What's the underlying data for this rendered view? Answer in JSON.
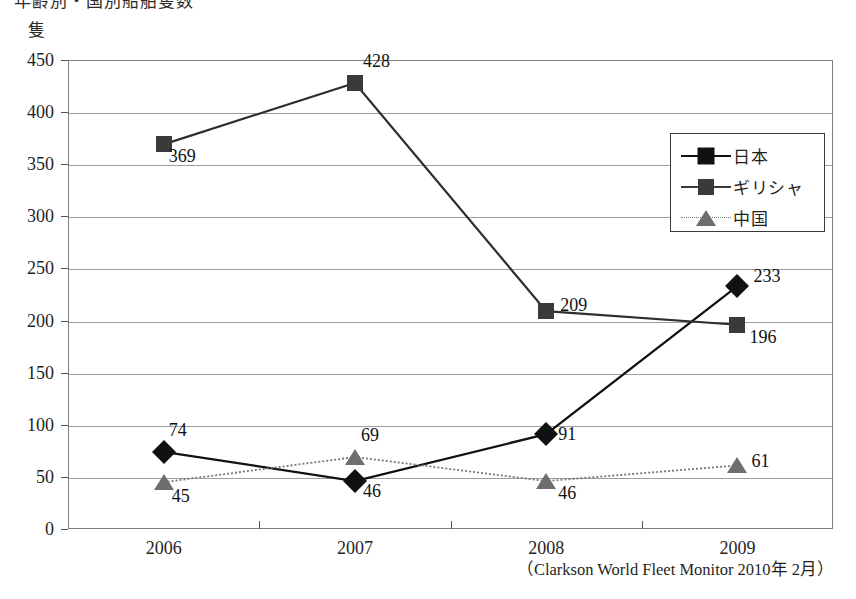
{
  "title_cut_off": "年齢別・国別船舶隻数",
  "unit_label": "隻",
  "source_note": "（Clarkson World Fleet Monitor 2010年 2月）",
  "legend": {
    "position": "top-right-inside",
    "items": [
      {
        "label": "日本",
        "marker": "diamond-marker",
        "color": "#111111"
      },
      {
        "label": "ギリシャ",
        "marker": "square-marker",
        "color": "#3a3a3a"
      },
      {
        "label": "中国",
        "marker": "triangle-marker",
        "color": "#6e6e6e"
      }
    ]
  },
  "chart_data": {
    "type": "line",
    "title": "年齢別・国別船舶隻数",
    "xlabel": "",
    "ylabel": "隻",
    "categories": [
      "2006",
      "2007",
      "2008",
      "2009"
    ],
    "ylim": [
      0,
      450
    ],
    "ytick_labels": [
      "0",
      "50",
      "100",
      "150",
      "200",
      "250",
      "300",
      "350",
      "400",
      "450"
    ],
    "ytick_values": [
      0,
      50,
      100,
      150,
      200,
      250,
      300,
      350,
      400,
      450
    ],
    "grid": true,
    "legend_position": "upper right",
    "annotation": "（Clarkson World Fleet Monitor 2010年 2月）",
    "series": [
      {
        "name": "日本",
        "marker": "diamond",
        "color": "#111111",
        "values": [
          74,
          46,
          91,
          233
        ]
      },
      {
        "name": "ギリシャ",
        "marker": "square",
        "color": "#3a3a3a",
        "values": [
          369,
          428,
          209,
          196
        ]
      },
      {
        "name": "中国",
        "marker": "triangle",
        "color": "#6e6e6e",
        "values": [
          45,
          69,
          46,
          61
        ]
      }
    ],
    "point_labels": {
      "日本": [
        "74",
        "46",
        "91",
        "233"
      ],
      "ギリシャ": [
        "369",
        "428",
        "209",
        "196"
      ],
      "中国": [
        "45",
        "69",
        "46",
        "61"
      ]
    }
  }
}
